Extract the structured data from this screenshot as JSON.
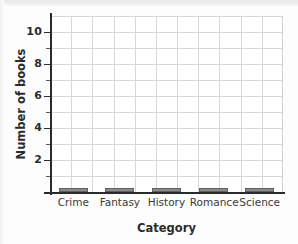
{
  "chart_data": {
    "type": "bar",
    "title": "",
    "subtitle": "",
    "xlabel": "Category",
    "ylabel": "Number of books",
    "categories": [
      "Crime",
      "Fantasy",
      "History",
      "Romance",
      "Science"
    ],
    "values": [
      0.2,
      0.2,
      0.2,
      0.2,
      0.2
    ],
    "series": [
      {
        "name": "Number of books",
        "values": [
          0.2,
          0.2,
          0.2,
          0.2,
          0.2
        ]
      }
    ],
    "ylim": [
      0,
      11
    ],
    "xlim": [
      0,
      5
    ],
    "y_tick_labels": [
      "2",
      "4",
      "6",
      "8",
      "10"
    ],
    "y_tick_values": [
      2,
      4,
      6,
      8,
      10
    ],
    "y_minor_tick_values": [
      1,
      3,
      5,
      7,
      9
    ],
    "grid": true,
    "grid_horizontal_values": [
      1,
      2,
      3,
      4,
      5,
      6,
      7,
      8,
      9,
      10,
      11
    ],
    "grid_vertical_count": 10,
    "legend": null,
    "legend_position": "none",
    "annotations": [],
    "colors": {
      "bar_fill": "#8a8a8a",
      "bar_edge": "#5f5f5f",
      "grid": "#d8d8d8",
      "axis": "#2b2b2b",
      "text": "#2b2b2b",
      "background": "#ffffff",
      "page_background": "#fdfdfd"
    }
  }
}
